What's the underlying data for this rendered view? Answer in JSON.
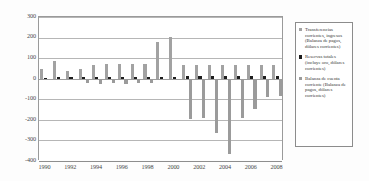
{
  "chart_data": {
    "type": "bar",
    "title": "",
    "xlabel": "",
    "ylabel": "",
    "ylim": [
      -400,
      300
    ],
    "yticks": [
      300,
      200,
      100,
      0,
      -100,
      -200,
      -300,
      -400
    ],
    "ytick_labels": [
      "300",
      "200",
      "100",
      "0",
      "-100",
      "-200",
      "-300",
      "-400"
    ],
    "grid": true,
    "legend_position": "right",
    "categories": [
      "1990",
      "1991",
      "1992",
      "1993",
      "1994",
      "1995",
      "1996",
      "1997",
      "1998",
      "1999",
      "2000",
      "2001",
      "2002",
      "2003",
      "2004",
      "2005",
      "2006",
      "2007",
      "2008"
    ],
    "xtick_labels": [
      "1990",
      "1992",
      "1994",
      "1996",
      "1998",
      "2000",
      "2002",
      "2004",
      "2006",
      "2008"
    ],
    "series": [
      {
        "name": "Transferencias corrientes, ingresos (Balanza de pagos, dólares corrientes)",
        "color": "#a2a2a2",
        "values": [
          45,
          85,
          38,
          45,
          68,
          70,
          72,
          70,
          70,
          180,
          205,
          68,
          68,
          68,
          68,
          68,
          68,
          68,
          68
        ]
      },
      {
        "name": "Reservas totales (incluye oro, dólares corrientes)",
        "color": "#1c1c1c",
        "values": [
          5,
          10,
          8,
          10,
          8,
          8,
          8,
          8,
          8,
          8,
          8,
          12,
          12,
          14,
          14,
          14,
          14,
          14,
          12
        ]
      },
      {
        "name": "Balanza de cuenta corriente (Balanza de pagos, dólares corrientes)",
        "color": "#9b9b9b",
        "values": [
          0,
          0,
          0,
          -20,
          -25,
          -22,
          -25,
          -22,
          -20,
          -5,
          -5,
          -195,
          -192,
          -265,
          -365,
          -192,
          -148,
          -88,
          -82
        ]
      }
    ]
  },
  "legend": {
    "entries": [
      {
        "label": "Transferencias corrientes, ingresos (Balanza de pagos, dólares corrientes)",
        "swatch": "s0"
      },
      {
        "label": "Reservas totales (incluye oro, dólares corrientes)",
        "swatch": "s1"
      },
      {
        "label": "Balanza de cuenta corriente (Balanza de pagos, dólares corrientes)",
        "swatch": "s2"
      }
    ]
  }
}
